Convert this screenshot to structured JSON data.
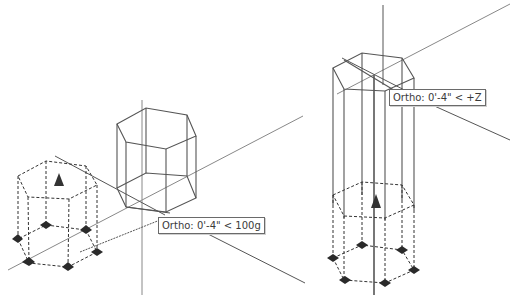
{
  "viewports": [
    {
      "id": "left",
      "tooltip": {
        "mode": "Ortho",
        "label": "Ortho: 0'-4\" < 100g"
      }
    },
    {
      "id": "right",
      "tooltip": {
        "mode": "Ortho",
        "label": "Ortho: 0'-4\" < +Z"
      }
    }
  ],
  "colors": {
    "background": "#ffffff",
    "wireframe": "#555555",
    "ghost_dashed": "#333333",
    "grip": "#333333",
    "axis_line": "#888888",
    "tooltip_border": "#6a6a6a",
    "tooltip_text": "#3a3a3a"
  },
  "icons": {
    "base_grip": "triangle-grip-icon",
    "vertex_grip": "diamond-grip-icon"
  }
}
